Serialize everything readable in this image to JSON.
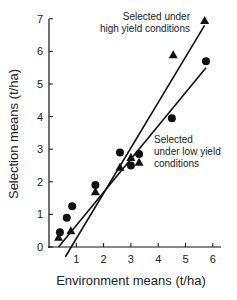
{
  "chart_data": {
    "type": "scatter",
    "title": "",
    "xlabel": "Environment means (t/ha)",
    "ylabel": "Selection means (t/ha)",
    "xlim": [
      0,
      6.2
    ],
    "ylim": [
      0,
      7
    ],
    "x_ticks": [
      1,
      2,
      3,
      4,
      5,
      6
    ],
    "y_ticks": [
      0,
      1,
      2,
      3,
      4,
      5,
      6,
      7
    ],
    "grid": false,
    "annotations": [
      {
        "text_lines": [
          "Selected under",
          "high yield conditions"
        ],
        "refers_to": "high_yield"
      },
      {
        "text_lines": [
          "Selected",
          "under low yield",
          "conditions"
        ],
        "refers_to": "low_yield"
      }
    ],
    "series": [
      {
        "id": "high_yield",
        "name": "Selected under high yield conditions",
        "marker": "triangle",
        "points": [
          {
            "x": 0.35,
            "y": 0.3
          },
          {
            "x": 0.8,
            "y": 0.5
          },
          {
            "x": 1.7,
            "y": 1.7
          },
          {
            "x": 2.6,
            "y": 2.45
          },
          {
            "x": 3.0,
            "y": 2.75
          },
          {
            "x": 3.3,
            "y": 2.6
          },
          {
            "x": 4.55,
            "y": 5.9
          },
          {
            "x": 5.7,
            "y": 6.95
          }
        ],
        "fit_line": {
          "x1": 0.6,
          "y1": -0.3,
          "x2": 5.7,
          "y2": 6.8
        }
      },
      {
        "id": "low_yield",
        "name": "Selected under low yield conditions",
        "marker": "circle",
        "points": [
          {
            "x": 0.4,
            "y": 0.45
          },
          {
            "x": 0.65,
            "y": 0.9
          },
          {
            "x": 0.85,
            "y": 1.25
          },
          {
            "x": 1.7,
            "y": 1.9
          },
          {
            "x": 2.6,
            "y": 2.9
          },
          {
            "x": 3.0,
            "y": 2.5
          },
          {
            "x": 3.3,
            "y": 2.85
          },
          {
            "x": 4.5,
            "y": 3.95
          },
          {
            "x": 5.75,
            "y": 5.7
          }
        ],
        "fit_line": {
          "x1": 0.35,
          "y1": 0.0,
          "x2": 5.75,
          "y2": 5.5
        }
      }
    ]
  }
}
